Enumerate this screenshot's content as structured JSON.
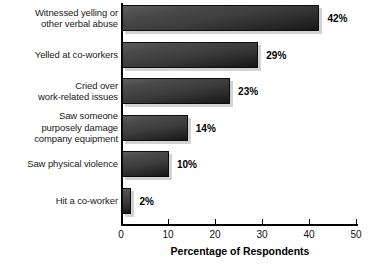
{
  "chart_data": {
    "type": "bar",
    "orientation": "horizontal",
    "title": "",
    "xlabel": "Percentage of Respondents",
    "ylabel": "",
    "categories": [
      "Witnessed yelling or other verbal abuse",
      "Yelled at co-workers",
      "Cried over work-related issues",
      "Saw someone purposely damage company equipment",
      "Saw physical violence",
      "Hit a co-worker"
    ],
    "category_lines": [
      [
        "Witnessed yelling or",
        "other verbal abuse"
      ],
      [
        "Yelled at co-workers"
      ],
      [
        "Cried over",
        "work-related issues"
      ],
      [
        "Saw someone",
        "purposely damage",
        "company equipment"
      ],
      [
        "Saw physical violence"
      ],
      [
        "Hit a co-worker"
      ]
    ],
    "values": [
      42,
      29,
      23,
      14,
      10,
      2
    ],
    "value_labels": [
      "42%",
      "29%",
      "23%",
      "14%",
      "10%",
      "2%"
    ],
    "xlim": [
      0,
      50
    ],
    "xticks": [
      0,
      10,
      20,
      30,
      40,
      50
    ],
    "xtick_labels": [
      "0",
      "10",
      "20",
      "30",
      "40",
      "50"
    ],
    "grid": false,
    "legend": null,
    "bar_color": "#3c3c3c",
    "bar_shadow_color": "#d2d2d2",
    "background_color": "#ffffff"
  }
}
